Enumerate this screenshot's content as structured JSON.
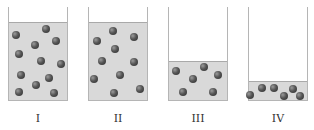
{
  "figure": {
    "colors": {
      "gas_fill": "#d9d9d9",
      "gas_top_border": "#a9a9a9",
      "wall": "#b5b5b5",
      "particle": "#3a3a3a",
      "label": "#333333"
    },
    "containers": [
      {
        "label": "I",
        "x": 8,
        "width": 60,
        "wall_top": 7,
        "bottom": 101,
        "gas_top": 22,
        "particle_count": 13,
        "particles": [
          [
            16,
            35
          ],
          [
            46,
            29
          ],
          [
            35,
            45
          ],
          [
            56,
            41
          ],
          [
            19,
            54
          ],
          [
            41,
            61
          ],
          [
            61,
            64
          ],
          [
            21,
            75
          ],
          [
            49,
            78
          ],
          [
            36,
            85
          ],
          [
            19,
            92
          ],
          [
            54,
            93
          ]
        ]
      },
      {
        "label": "II",
        "x": 88,
        "width": 60,
        "wall_top": 7,
        "bottom": 101,
        "gas_top": 22,
        "particle_count": 11,
        "particles": [
          [
            113,
            31
          ],
          [
            134,
            37
          ],
          [
            97,
            41
          ],
          [
            115,
            49
          ],
          [
            102,
            61
          ],
          [
            134,
            62
          ],
          [
            94,
            79
          ],
          [
            120,
            75
          ],
          [
            114,
            93
          ],
          [
            140,
            89
          ]
        ]
      },
      {
        "label": "III",
        "x": 168,
        "width": 60,
        "wall_top": 7,
        "bottom": 101,
        "gas_top": 61,
        "particle_count": 6,
        "particles": [
          [
            176,
            71
          ],
          [
            204,
            67
          ],
          [
            193,
            79
          ],
          [
            218,
            75
          ],
          [
            183,
            92
          ],
          [
            213,
            92
          ]
        ]
      },
      {
        "label": "IV",
        "x": 248,
        "width": 60,
        "wall_top": 7,
        "bottom": 101,
        "gas_top": 81,
        "particle_count": 7,
        "particles": [
          [
            262,
            88
          ],
          [
            274,
            88
          ],
          [
            250,
            95
          ],
          [
            284,
            96
          ],
          [
            293,
            89
          ],
          [
            300,
            96
          ]
        ]
      }
    ]
  }
}
